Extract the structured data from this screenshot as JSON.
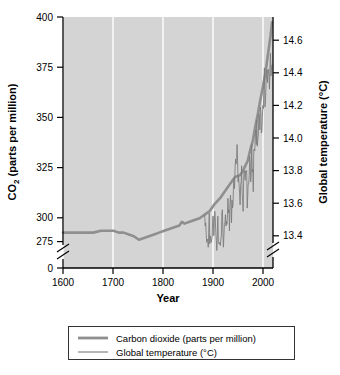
{
  "chart_data": {
    "type": "line",
    "title": "",
    "xlabel": "Year",
    "ylabel": "CO2 (parts per million)",
    "ylabel_right": "Global temperature (°C)",
    "xlim": [
      1600,
      2015
    ],
    "ylim": [
      275,
      400
    ],
    "ylim_right": [
      13.15,
      14.7
    ],
    "xticks": [
      1600,
      1700,
      1800,
      1900,
      2000
    ],
    "xtick_labels": [
      "1600",
      "1700",
      "1800",
      "1900",
      "2000"
    ],
    "yticks": [
      275,
      300,
      325,
      350,
      375,
      400
    ],
    "ytick_labels": [
      "275",
      "300",
      "325",
      "350",
      "375",
      "400"
    ],
    "y_axis_break_label": "0",
    "yticks_right": [
      13.2,
      13.4,
      13.6,
      13.8,
      14.0,
      14.2,
      14.4,
      14.6
    ],
    "ytick_labels_right": [
      "13.2",
      "13.4",
      "13.6",
      "13.8",
      "14.0",
      "14.2",
      "14.4",
      "14.6"
    ],
    "grid": "vertical-white-gridlines-at-xticks",
    "legend_position": "below-axes",
    "axis_break": "both y-axes broken between lowest tick and zero",
    "series": [
      {
        "name": "Carbon dioxide (parts per million)",
        "axis": "left",
        "unit": "ppm",
        "line_style": "thick",
        "color": "#8f8f8f",
        "x": [
          1600,
          1620,
          1640,
          1660,
          1675,
          1690,
          1700,
          1710,
          1720,
          1730,
          1740,
          1750,
          1760,
          1770,
          1780,
          1790,
          1800,
          1810,
          1820,
          1830,
          1835,
          1840,
          1850,
          1860,
          1870,
          1880,
          1890,
          1900,
          1910,
          1920,
          1930,
          1940,
          1950,
          1955,
          1960,
          1965,
          1970,
          1975,
          1980,
          1985,
          1990,
          1995,
          2000,
          2005,
          2010,
          2013
        ],
        "values": [
          280,
          280,
          280,
          280,
          281,
          281,
          281,
          280,
          280,
          279,
          278,
          276,
          277,
          278,
          279,
          280,
          281,
          282,
          283,
          284,
          286,
          285,
          286,
          287,
          288,
          290,
          292,
          296,
          299,
          303,
          307,
          311,
          312,
          314,
          317,
          320,
          326,
          331,
          339,
          346,
          354,
          361,
          369,
          379,
          389,
          397
        ]
      },
      {
        "name": "Global temperature (°C)",
        "axis": "right",
        "unit": "°C",
        "line_style": "thin",
        "color": "#7a7a7a",
        "x": [
          1880,
          1881,
          1882,
          1883,
          1884,
          1885,
          1886,
          1887,
          1888,
          1889,
          1890,
          1891,
          1892,
          1893,
          1894,
          1895,
          1896,
          1897,
          1898,
          1899,
          1900,
          1901,
          1902,
          1903,
          1904,
          1905,
          1906,
          1907,
          1908,
          1909,
          1910,
          1911,
          1912,
          1913,
          1914,
          1915,
          1916,
          1917,
          1918,
          1919,
          1920,
          1921,
          1922,
          1923,
          1924,
          1925,
          1926,
          1927,
          1928,
          1929,
          1930,
          1931,
          1932,
          1933,
          1934,
          1935,
          1936,
          1937,
          1938,
          1939,
          1940,
          1941,
          1942,
          1943,
          1944,
          1945,
          1946,
          1947,
          1948,
          1949,
          1950,
          1951,
          1952,
          1953,
          1954,
          1955,
          1956,
          1957,
          1958,
          1959,
          1960,
          1961,
          1962,
          1963,
          1964,
          1965,
          1966,
          1967,
          1968,
          1969,
          1970,
          1971,
          1972,
          1973,
          1974,
          1975,
          1976,
          1977,
          1978,
          1979,
          1980,
          1981,
          1982,
          1983,
          1984,
          1985,
          1986,
          1987,
          1988,
          1989,
          1990,
          1991,
          1992,
          1993,
          1994,
          1995,
          1996,
          1997,
          1998,
          1999,
          2000,
          2001,
          2002,
          2003,
          2004,
          2005,
          2006,
          2007,
          2008,
          2009,
          2010,
          2011,
          2012,
          2013
        ],
        "values": [
          13.53,
          13.46,
          13.48,
          13.41,
          13.36,
          13.37,
          13.38,
          13.33,
          13.42,
          13.54,
          13.35,
          13.4,
          13.37,
          13.36,
          13.38,
          13.4,
          13.52,
          13.52,
          13.4,
          13.48,
          13.55,
          13.5,
          13.42,
          13.37,
          13.31,
          13.4,
          13.52,
          13.36,
          13.35,
          13.35,
          13.36,
          13.34,
          13.38,
          13.4,
          13.54,
          13.56,
          13.42,
          13.33,
          13.4,
          13.47,
          13.48,
          13.53,
          13.46,
          13.49,
          13.47,
          13.53,
          13.63,
          13.54,
          13.56,
          13.43,
          13.6,
          13.65,
          13.59,
          13.48,
          13.62,
          13.57,
          13.59,
          13.72,
          13.75,
          13.69,
          13.81,
          13.87,
          13.84,
          13.86,
          13.96,
          13.86,
          13.73,
          13.77,
          13.71,
          13.66,
          13.59,
          13.71,
          13.73,
          13.83,
          13.66,
          13.62,
          13.55,
          13.74,
          13.8,
          13.78,
          13.74,
          13.8,
          13.79,
          13.8,
          13.57,
          13.64,
          13.72,
          13.72,
          13.77,
          13.89,
          13.84,
          13.73,
          13.79,
          13.96,
          13.79,
          13.81,
          13.67,
          13.93,
          13.93,
          13.92,
          14.01,
          14.05,
          13.96,
          14.11,
          13.95,
          13.99,
          14.02,
          14.15,
          14.13,
          14.05,
          14.19,
          14.16,
          14.03,
          14.04,
          14.13,
          14.2,
          14.18,
          14.32,
          14.43,
          14.19,
          14.22,
          14.3,
          14.39,
          14.42,
          14.34,
          14.42,
          14.42,
          14.38,
          14.3,
          14.43,
          14.52,
          14.38,
          14.43,
          14.45
        ]
      }
    ],
    "legend_entries": [
      {
        "label": "Carbon dioxide (parts per million)",
        "style": "thick",
        "color": "#8f8f8f"
      },
      {
        "label": "Global temperature (°C)",
        "style": "thin",
        "color": "#7a7a7a"
      }
    ],
    "colors": {
      "plot_background": "#d4d4d4",
      "gridline": "#ffffff",
      "axis": "#000000",
      "page_background": "#ffffff"
    }
  },
  "axes": {
    "left_title_main": "CO",
    "left_title_sub": "2",
    "left_title_rest": " (parts per million)",
    "right_title": "Global temperature (°C)",
    "x_title": "Year"
  }
}
